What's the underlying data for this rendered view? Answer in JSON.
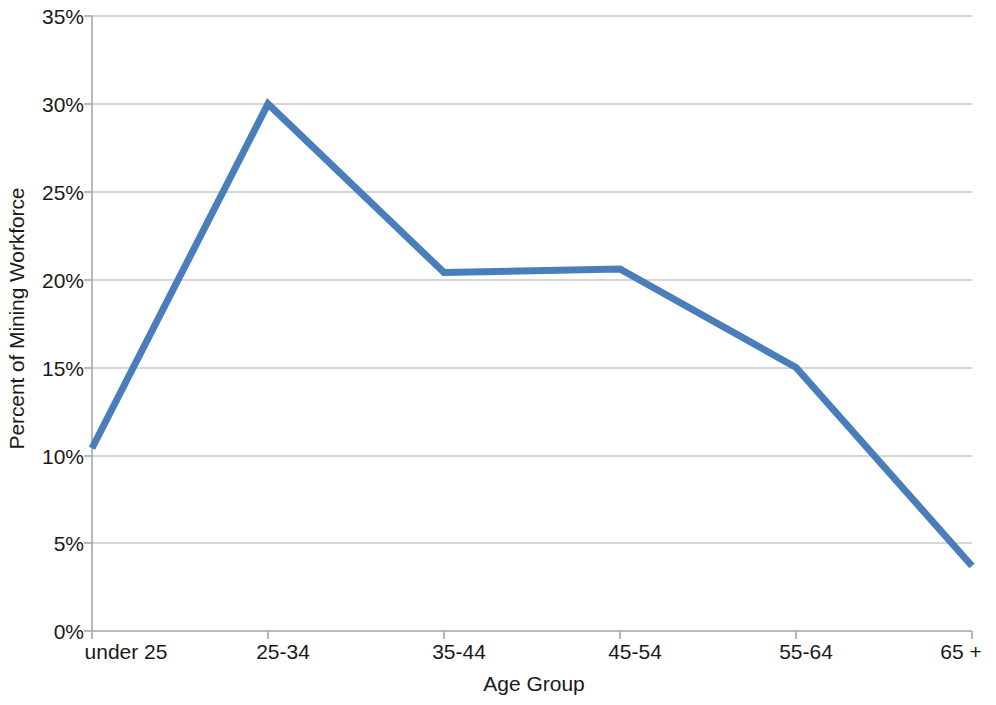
{
  "chart_data": {
    "type": "line",
    "title": "",
    "xlabel": "Age Group",
    "ylabel": "Percent of Mining Workforce",
    "categories": [
      "under 25",
      "25-34",
      "35-44",
      "45-54",
      "55-64",
      "65 +"
    ],
    "values": [
      10.4,
      30.0,
      20.4,
      20.6,
      15.0,
      3.7
    ],
    "series": [
      {
        "name": "Percent of Mining Workforce",
        "values": [
          10.4,
          30.0,
          20.4,
          20.6,
          15.0,
          3.7
        ],
        "color": "#4a7ebb"
      }
    ],
    "ylim": [
      0,
      35
    ],
    "ytick_values": [
      0,
      5,
      10,
      15,
      20,
      25,
      30,
      35
    ],
    "ytick_labels": [
      "0%",
      "5%",
      "10%",
      "15%",
      "20%",
      "25%",
      "30%",
      "35%"
    ],
    "grid": "horizontal",
    "legend": "none",
    "line_width_px": 7,
    "markers": "none"
  },
  "axes": {
    "y_title": "Percent of Mining Workforce",
    "x_title": "Age Group",
    "y_labels": [
      "35%",
      "30%",
      "25%",
      "20%",
      "15%",
      "10%",
      "5%",
      "0%"
    ],
    "x_labels": [
      "under 25",
      "25-34",
      "35-44",
      "45-54",
      "55-64",
      "65 +"
    ]
  },
  "style": {
    "line_color": "#4a7ebb",
    "gridline_color": "#c8c8c8",
    "axis_color": "#a6a6a6",
    "background": "#ffffff",
    "text_color": "#1a1a1a"
  }
}
